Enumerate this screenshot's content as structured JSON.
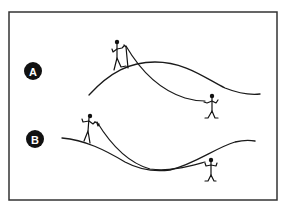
{
  "diagram": {
    "panels": [
      {
        "id": "A",
        "label": "A",
        "description": "Climber on crest of hill with rope curving down to a second person standing lower on the right slope",
        "badge": {
          "cx": 33,
          "cy": 71,
          "r": 9
        },
        "ground_path": "M89,95 C110,72 130,62 155,62 C185,62 205,78 225,88 C240,94 250,95 260,94",
        "rope_path": "M126,46 C140,70 160,90 185,98 C195,101 200,101 205,101",
        "figures": [
          {
            "name": "climber-top",
            "head": [
              117,
              42
            ]
          },
          {
            "name": "belayer-bottom",
            "head": [
              212,
              96
            ]
          }
        ]
      },
      {
        "id": "B",
        "label": "B",
        "description": "Climber on left ridge with rope running down through a valley to a second person on the right",
        "badge": {
          "cx": 35,
          "cy": 139,
          "r": 9
        },
        "ground_path": "M62,138 C85,140 105,150 125,162 C140,170 155,172 170,170 C195,164 215,148 235,142 C243,140 250,140 255,141",
        "rope_path": "M97,122 C108,140 125,162 150,169 C170,172 190,166 205,162",
        "figures": [
          {
            "name": "climber-left",
            "head": [
              90,
              116
            ]
          },
          {
            "name": "belayer-right",
            "head": [
              211,
              160
            ]
          }
        ]
      }
    ],
    "colors": {
      "line": "#1a1a1a",
      "badge": "#111111",
      "badge_text": "#ffffff",
      "frame": "#333333",
      "background": "#ffffff"
    }
  }
}
